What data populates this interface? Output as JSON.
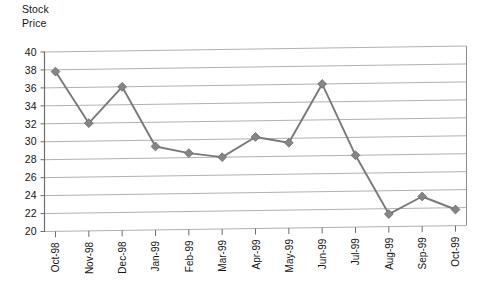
{
  "chart_data": {
    "type": "line",
    "title": "",
    "ylabel": "Stock\nPrice",
    "xlabel": "",
    "ylim": [
      20,
      40
    ],
    "ytick_step": 2,
    "yticks": [
      40,
      38,
      36,
      34,
      32,
      30,
      28,
      26,
      24,
      22,
      20
    ],
    "grid": true,
    "legend": "none",
    "categories": [
      "Oct-98",
      "Nov-98",
      "Dec-98",
      "Jan-99",
      "Feb-99",
      "Mar-99",
      "Apr-99",
      "May-99",
      "Jun-99",
      "Jul-99",
      "Aug-99",
      "Sep-99",
      "Oct-99"
    ],
    "values": [
      37.8,
      32.0,
      36.0,
      29.3,
      28.5,
      28.0,
      30.2,
      29.5,
      36.0,
      28.0,
      21.4,
      23.3,
      21.8
    ],
    "series": [
      {
        "name": "Stock Price",
        "marker": "diamond",
        "color": "#858585",
        "values": [
          37.8,
          32.0,
          36.0,
          29.3,
          28.5,
          28.0,
          30.2,
          29.5,
          36.0,
          28.0,
          21.4,
          23.3,
          21.8
        ]
      }
    ]
  },
  "colors": {
    "series": "#858585",
    "gridline": "#a8a8a8",
    "axis": "#6e6e6e",
    "text": "#151515",
    "background": "#ffffff"
  }
}
